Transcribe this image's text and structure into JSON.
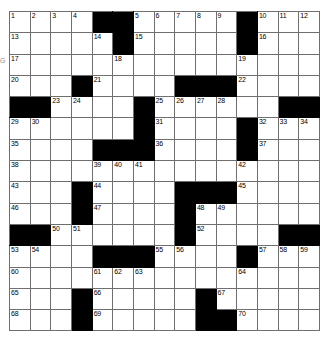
{
  "puzzle": {
    "type": "crossword-grid",
    "rows": 15,
    "cols": 15,
    "colors": {
      "block": "#000000",
      "cell": "#ffffff",
      "gridline": "#6f6f6f",
      "number_text": "#000000"
    },
    "edge_marks": [
      {
        "name": "left-edge-letter",
        "text": "G"
      }
    ],
    "cells": [
      [
        {
          "n": "1"
        },
        {
          "n": "2"
        },
        {
          "n": "3"
        },
        {
          "n": "4"
        },
        {
          "b": true
        },
        {
          "b": true
        },
        {
          "n": "5"
        },
        {
          "n": "6"
        },
        {
          "n": "7"
        },
        {
          "n": "8"
        },
        {
          "n": "9"
        },
        {
          "b": true
        },
        {
          "n": "10"
        },
        {
          "n": "11"
        },
        {
          "n": "12"
        }
      ],
      [
        {
          "n": "13"
        },
        {},
        {},
        {},
        {
          "n": "14"
        },
        {
          "b": true
        },
        {
          "n": "15"
        },
        {},
        {},
        {},
        {},
        {
          "b": true
        },
        {
          "n": "16"
        },
        {},
        {}
      ],
      [
        {
          "n": "17"
        },
        {},
        {},
        {},
        {},
        {
          "n": "18"
        },
        {},
        {},
        {},
        {},
        {},
        {
          "n": "19"
        },
        {},
        {},
        {}
      ],
      [
        {
          "n": "20"
        },
        {},
        {},
        {
          "b": true
        },
        {
          "n": "21"
        },
        {},
        {},
        {},
        {
          "b": true
        },
        {
          "b": true
        },
        {
          "b": true
        },
        {
          "n": "22"
        },
        {},
        {},
        {}
      ],
      [
        {
          "b": true
        },
        {
          "b": true
        },
        {
          "n": "23"
        },
        {
          "n": "24"
        },
        {},
        {},
        {
          "b": true
        },
        {
          "n": "25"
        },
        {
          "n": "26"
        },
        {
          "n": "27"
        },
        {
          "n": "28"
        },
        {},
        {},
        {
          "b": true
        },
        {
          "b": true
        }
      ],
      [
        {
          "n": "29"
        },
        {
          "n": "30"
        },
        {},
        {},
        {},
        {},
        {
          "b": true
        },
        {
          "n": "31"
        },
        {},
        {},
        {},
        {
          "b": true
        },
        {
          "n": "32"
        },
        {
          "n": "33"
        },
        {
          "n": "34"
        }
      ],
      [
        {
          "n": "35"
        },
        {},
        {},
        {},
        {
          "b": true
        },
        {
          "b": true
        },
        {
          "b": true
        },
        {
          "n": "36"
        },
        {},
        {},
        {},
        {
          "b": true
        },
        {
          "n": "37"
        },
        {},
        {}
      ],
      [
        {
          "n": "38"
        },
        {},
        {},
        {},
        {
          "n": "39"
        },
        {
          "n": "40"
        },
        {
          "n": "41"
        },
        {},
        {},
        {},
        {},
        {
          "n": "42"
        },
        {},
        {},
        {}
      ],
      [
        {
          "n": "43"
        },
        {},
        {},
        {
          "b": true
        },
        {
          "n": "44"
        },
        {},
        {},
        {},
        {
          "b": true
        },
        {
          "b": true
        },
        {
          "b": true
        },
        {
          "n": "45"
        },
        {},
        {},
        {}
      ],
      [
        {
          "n": "46"
        },
        {},
        {},
        {
          "b": true
        },
        {
          "n": "47"
        },
        {},
        {},
        {},
        {
          "b": true
        },
        {
          "n": "48"
        },
        {
          "n": "49"
        },
        {},
        {},
        {},
        {}
      ],
      [
        {
          "b": true
        },
        {
          "b": true
        },
        {
          "n": "50"
        },
        {
          "n": "51"
        },
        {},
        {},
        {},
        {},
        {
          "b": true
        },
        {
          "n": "52"
        },
        {},
        {},
        {},
        {
          "b": true
        },
        {
          "b": true
        }
      ],
      [
        {
          "n": "53"
        },
        {
          "n": "54"
        },
        {},
        {},
        {
          "b": true
        },
        {
          "b": true
        },
        {
          "b": true
        },
        {
          "n": "55"
        },
        {
          "n": "56"
        },
        {},
        {},
        {
          "b": true
        },
        {
          "n": "57"
        },
        {
          "n": "58"
        },
        {
          "n": "59"
        }
      ],
      [
        {
          "n": "60"
        },
        {},
        {},
        {},
        {
          "n": "61"
        },
        {
          "n": "62"
        },
        {
          "n": "63"
        },
        {},
        {},
        {},
        {},
        {
          "n": "64"
        },
        {},
        {},
        {}
      ],
      [
        {
          "n": "65"
        },
        {},
        {},
        {
          "b": true
        },
        {
          "n": "66"
        },
        {},
        {},
        {},
        {},
        {
          "b": true
        },
        {
          "n": "67"
        },
        {},
        {},
        {},
        {}
      ],
      [
        {
          "n": "68"
        },
        {},
        {},
        {
          "b": true
        },
        {
          "n": "69"
        },
        {},
        {},
        {},
        {},
        {
          "b": true
        },
        {
          "b": true
        },
        {
          "n": "70"
        },
        {},
        {},
        {}
      ]
    ]
  }
}
